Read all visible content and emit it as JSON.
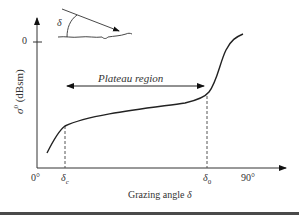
{
  "figure": {
    "title": "",
    "y_axis": {
      "label": "σ⁰ (dBsm)",
      "label_symbol": "σ",
      "label_superscript": "0",
      "label_units": " (dBsm)",
      "tick_label": "0"
    },
    "x_axis": {
      "label": "Grazing angle δ",
      "label_text": "Grazing angle ",
      "label_symbol": "δ",
      "ticks": {
        "origin": "0°",
        "delta_c_symbol": "δ",
        "delta_c_sub": "c",
        "delta_0_symbol": "δ",
        "delta_0_sub": "0",
        "ninety": "90°"
      }
    },
    "annotation": {
      "plateau": "Plateau region"
    },
    "inset": {
      "angle_symbol": "δ",
      "description": "incident ray at grazing angle δ onto rough surface"
    },
    "colors": {
      "line": "#222222",
      "text": "#333333",
      "dashed": "#555555",
      "background": "#ffffff"
    }
  }
}
